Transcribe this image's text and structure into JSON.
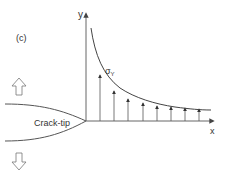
{
  "figure": {
    "panel_label": "(c)",
    "axes": {
      "x_label": "x",
      "y_label": "y"
    },
    "stress_label": "σ",
    "stress_subscript": "Y",
    "crack_label": "Crack-tip",
    "colors": {
      "line": "#555555",
      "text": "#333333",
      "background": "#ffffff"
    },
    "load_arrows": [
      "opening-up",
      "opening-down"
    ],
    "stress_arrow_count": 8
  }
}
